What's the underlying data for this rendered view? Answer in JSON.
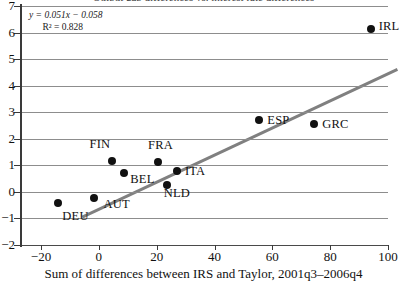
{
  "figure": {
    "clipped_title": "Output gap differences vs. interest rate differences",
    "annotation": {
      "equation": "y = 0.051x − 0.058",
      "r_squared": "R² = 0.828"
    }
  },
  "chart_data": {
    "type": "scatter",
    "title": "",
    "xlabel": "Sum of differences between IRS and Taylor, 2001q3–2006q4",
    "ylabel": "",
    "xlim": [
      -20,
      100
    ],
    "ylim": [
      -2,
      7
    ],
    "xticks": [
      -20,
      0,
      20,
      40,
      60,
      80,
      100
    ],
    "yticks": [
      -2,
      -1,
      0,
      1,
      2,
      3,
      4,
      5,
      6,
      7
    ],
    "xtick_labels": [
      "−20",
      "0",
      "20",
      "40",
      "60",
      "80",
      "100"
    ],
    "ytick_labels": [
      "−2",
      "−1",
      "0",
      "1",
      "2",
      "3",
      "4",
      "5",
      "6",
      "7"
    ],
    "grid": "horizontal",
    "legend": "none",
    "points": [
      {
        "label": "DEU",
        "x": -14.0,
        "y": -0.4,
        "label_dx": 4,
        "label_dy": 14
      },
      {
        "label": "AUT",
        "x": -1.5,
        "y": -0.22,
        "label_dx": 9,
        "label_dy": 7
      },
      {
        "label": "FIN",
        "x": 4.4,
        "y": 1.18,
        "label_dx": -22,
        "label_dy": -16
      },
      {
        "label": "BEL",
        "x": 8.8,
        "y": 0.7,
        "label_dx": 6,
        "label_dy": 7
      },
      {
        "label": "FRA",
        "x": 20.5,
        "y": 1.13,
        "label_dx": -10,
        "label_dy": -16
      },
      {
        "label": "NLD",
        "x": 23.5,
        "y": 0.25,
        "label_dx": -3,
        "label_dy": 9
      },
      {
        "label": "ITA",
        "x": 27.0,
        "y": 0.77,
        "label_dx": 8,
        "label_dy": 1
      },
      {
        "label": "ESP",
        "x": 55.5,
        "y": 2.72,
        "label_dx": 8,
        "label_dy": 1
      },
      {
        "label": "GRC",
        "x": 74.5,
        "y": 2.57,
        "label_dx": 8,
        "label_dy": 1
      },
      {
        "label": "IRL",
        "x": 94.0,
        "y": 6.15,
        "label_dx": 8,
        "label_dy": -2
      }
    ],
    "trendline": {
      "slope": 0.051,
      "intercept": -0.058,
      "r_squared": 0.828,
      "x_start": -13.0,
      "x_end": 96.0,
      "color": "#808080",
      "width": 3
    },
    "point_color": "#111111",
    "point_size": 8
  }
}
